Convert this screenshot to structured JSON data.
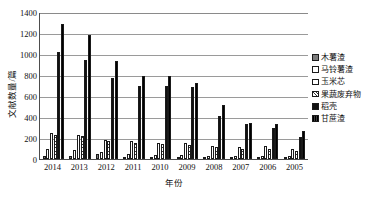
{
  "chart_data": {
    "type": "bar",
    "title": "",
    "xlabel": "年份",
    "ylabel": "文献数量/篇",
    "ylim": [
      0,
      1400
    ],
    "ytick_step": 200,
    "grid": true,
    "legend_position": "right",
    "categories": [
      "2014",
      "2013",
      "2012",
      "2011",
      "2010",
      "2009",
      "2008",
      "2007",
      "2006",
      "2005"
    ],
    "yticks": [
      "1400",
      "1200",
      "1000",
      "800",
      "600",
      "400",
      "200",
      "0"
    ],
    "series": [
      {
        "name": "木薯渣",
        "values": [
          30,
          25,
          45,
          18,
          20,
          18,
          15,
          12,
          10,
          22
        ]
      },
      {
        "name": "马铃薯渣",
        "values": [
          95,
          90,
          70,
          45,
          40,
          35,
          32,
          28,
          25,
          30
        ]
      },
      {
        "name": "玉米芯",
        "values": [
          248,
          228,
          185,
          175,
          155,
          150,
          128,
          110,
          120,
          95
        ]
      },
      {
        "name": "果蔬废弃物",
        "values": [
          225,
          222,
          170,
          150,
          140,
          135,
          115,
          100,
          95,
          80
        ]
      },
      {
        "name": "稻壳",
        "values": [
          1020,
          945,
          770,
          700,
          700,
          690,
          410,
          330,
          300,
          205
        ]
      },
      {
        "name": "甘蔗渣",
        "values": [
          1290,
          1180,
          935,
          790,
          790,
          720,
          510,
          345,
          330,
          270
        ]
      }
    ],
    "legend": [
      {
        "label": "木薯渣",
        "swatch": "gray-solid"
      },
      {
        "label": "马铃薯渣",
        "swatch": "vertical-hatch"
      },
      {
        "label": "玉米芯",
        "swatch": "white-solid"
      },
      {
        "label": "果蔬废弃物",
        "swatch": "diagonal-hatch"
      },
      {
        "label": "稻壳",
        "swatch": "black-solid"
      },
      {
        "label": "甘蔗渣",
        "swatch": "dark-hatch"
      }
    ],
    "colors": {
      "grid": "#9a9a9a",
      "axis": "#4d4d4d",
      "series": [
        "#7d7d7d",
        "#ffffff",
        "#ffffff",
        "#ffffff",
        "#111111",
        "#2f2f2f"
      ]
    }
  }
}
